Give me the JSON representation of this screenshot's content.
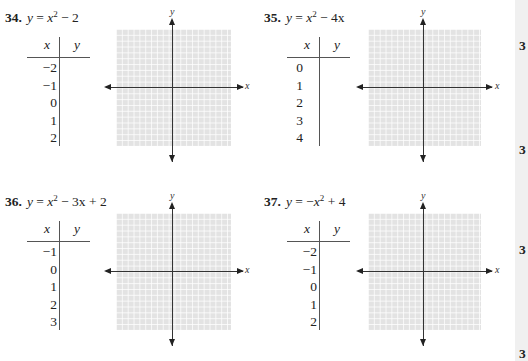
{
  "problems": [
    {
      "number": "34.",
      "equation": {
        "lhs": "y",
        "eq": " = ",
        "base": "x",
        "exp": "2",
        "rest": " − 2"
      },
      "table": {
        "header_x": "x",
        "header_y": "y",
        "x_values": [
          "−2",
          "−1",
          "0",
          "1",
          "2"
        ]
      },
      "graph": {
        "x_label": "x",
        "y_label": "y"
      }
    },
    {
      "number": "35.",
      "equation": {
        "lhs": "y",
        "eq": " = ",
        "base": "x",
        "exp": "2",
        "rest": " − 4x"
      },
      "table": {
        "header_x": "x",
        "header_y": "y",
        "x_values": [
          "0",
          "1",
          "2",
          "3",
          "4"
        ]
      },
      "graph": {
        "x_label": "x",
        "y_label": "y"
      }
    },
    {
      "number": "36.",
      "equation": {
        "lhs": "y",
        "eq": " = ",
        "base": "x",
        "exp": "2",
        "rest": " − 3x + 2"
      },
      "table": {
        "header_x": "x",
        "header_y": "y",
        "x_values": [
          "−1",
          "0",
          "1",
          "2",
          "3"
        ]
      },
      "graph": {
        "x_label": "x",
        "y_label": "y"
      }
    },
    {
      "number": "37.",
      "equation": {
        "lhs": "y",
        "eq": " = −",
        "base": "x",
        "exp": "2",
        "rest": " + 4"
      },
      "table": {
        "header_x": "x",
        "header_y": "y",
        "x_values": [
          "−2",
          "−1",
          "0",
          "1",
          "2"
        ]
      },
      "graph": {
        "x_label": "x",
        "y_label": "y"
      }
    }
  ],
  "right_strip": {
    "numbers": [
      "3",
      "3",
      "3",
      "3"
    ]
  }
}
